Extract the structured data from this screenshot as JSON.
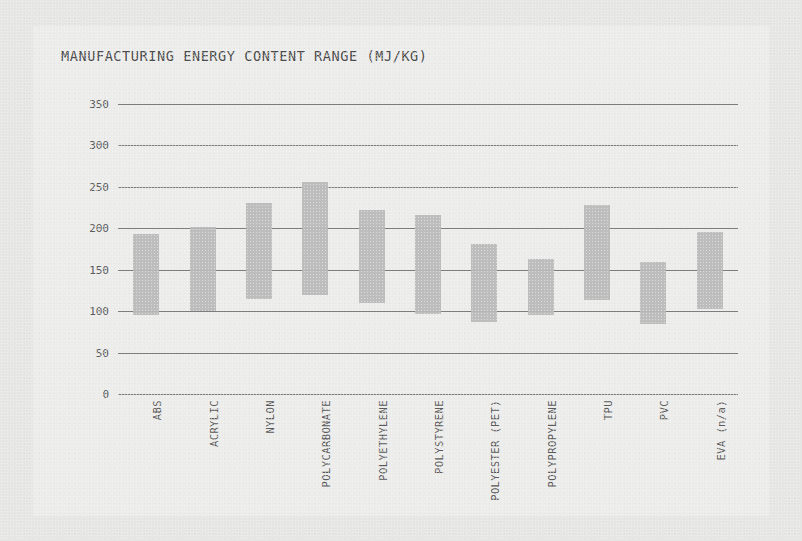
{
  "chart_data": {
    "type": "bar",
    "title": "MANUFACTURING ENERGY CONTENT RANGE (MJ/KG)",
    "xlabel": "",
    "ylabel": "",
    "ylim": [
      0,
      350
    ],
    "yticks": [
      0,
      50,
      100,
      150,
      200,
      250,
      300,
      350
    ],
    "grid": true,
    "legend": null,
    "bar_style": "floating-range",
    "categories": [
      "ABS",
      "ACRYLIC",
      "NYLON",
      "POLYCARBONATE",
      "POLYETHYLENE",
      "POLYSTYRENE",
      "POLYESTER (PET)",
      "POLYPROPYLENE",
      "TPU",
      "PVC",
      "EVA (n/a)"
    ],
    "series": [
      {
        "name": "low",
        "values": [
          95,
          100,
          115,
          120,
          110,
          97,
          87,
          95,
          113,
          85,
          103
        ]
      },
      {
        "name": "high",
        "values": [
          193,
          201,
          231,
          256,
          222,
          216,
          181,
          163,
          228,
          159,
          196
        ]
      }
    ],
    "bar_color": "#b9b9b9",
    "gridline_color": "#5e5e5e",
    "text_color": "#5a5a5a",
    "background_color": "#e6e6e4",
    "card_color": "#ececeb"
  }
}
